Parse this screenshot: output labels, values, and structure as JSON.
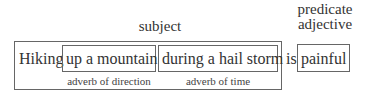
{
  "labels": {
    "subject": "subject",
    "predicate_line1": "predicate",
    "predicate_line2": "adjective"
  },
  "sentence": {
    "head": "Hiking",
    "phrase1": "up a mountain",
    "phrase2": "during a hail storm",
    "verb": "is",
    "predicate": "painful"
  },
  "annotations": {
    "phrase1": "adverb of direction",
    "phrase2": "adverb of time"
  }
}
